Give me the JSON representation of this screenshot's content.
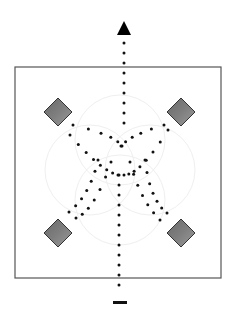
{
  "diagram": {
    "type": "movement-diagram",
    "colors": {
      "background": "#ffffff",
      "frame": "#555555",
      "dot": "#111111",
      "arrow": "#000000",
      "diamond_fill_dark": "#6a6a6a",
      "diamond_fill_light": "#9a9a9a",
      "diamond_stroke": "#333333",
      "faint_circle": "#eeeeee"
    },
    "frame": {
      "x": 15,
      "y": 67,
      "width": 206,
      "height": 211
    },
    "markers": [
      {
        "name": "cone-top-left",
        "cx": 58,
        "cy": 112
      },
      {
        "name": "cone-top-right",
        "cx": 181,
        "cy": 112
      },
      {
        "name": "cone-bottom-left",
        "cx": 58,
        "cy": 233
      },
      {
        "name": "cone-bottom-right",
        "cx": 181,
        "cy": 233
      }
    ],
    "start_marker": {
      "x": 113,
      "y": 301,
      "width": 14,
      "height": 3
    },
    "end_arrow": {
      "tip_x": 124,
      "tip_y": 21,
      "base_y": 35,
      "half_width": 7
    }
  }
}
